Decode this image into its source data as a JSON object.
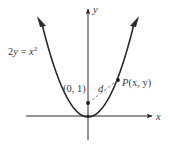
{
  "figure": {
    "equation_label": "2y = x²",
    "equation_parts": {
      "lhs": "2",
      "lhs_var": "y",
      "eq": " = ",
      "rhs_var": "x",
      "rhs_exp": "2"
    },
    "axis_x_label": "x",
    "axis_y_label": "y",
    "focus_point_label": "(0, 1)",
    "distance_label": "d",
    "curve_point_label_prefix": "P",
    "curve_point_label_args": "(x, y)",
    "colors": {
      "curve": "#2a2a2a",
      "axis": "#2a2a2a",
      "dashed": "#777777",
      "text": "#3a3a3a"
    }
  }
}
